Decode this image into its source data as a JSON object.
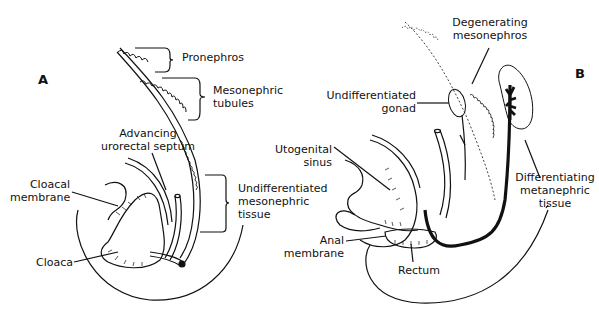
{
  "figure": {
    "panels": [
      {
        "id": "A"
      },
      {
        "id": "B"
      }
    ],
    "labels_a": {
      "pronephros": "Pronephros",
      "mesonephric_tubules_1": "Mesonephric",
      "mesonephric_tubules_2": "tubules",
      "advancing_1": "Advancing",
      "advancing_2": "urorectal septum",
      "cloacal_1": "Cloacal",
      "cloacal_2": "membrane",
      "undiff_1": "Undifferentiated",
      "undiff_2": "mesonephric",
      "undiff_3": "tissue",
      "cloaca": "Cloaca"
    },
    "labels_b": {
      "degen_1": "Degenerating",
      "degen_2": "mesonephros",
      "gonad_1": "Undifferentiated",
      "gonad_2": "gonad",
      "uro_1": "Utogenital",
      "uro_2": "sinus",
      "meta_1": "Differentiating",
      "meta_2": "metanephric",
      "meta_3": "tissue",
      "anal_1": "Anal",
      "anal_2": "membrane",
      "rectum": "Rectum"
    }
  }
}
